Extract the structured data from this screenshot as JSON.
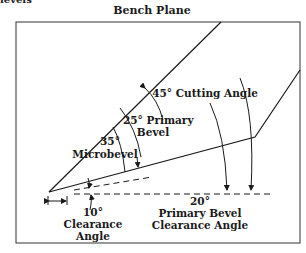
{
  "title": "Bench Plane",
  "top_fragment": "levels",
  "labels": {
    "cutting_angle": "45° Cutting Angle",
    "primary_bevel_deg": "25° Primary",
    "primary_bevel_word": "Bevel",
    "microbevel_deg": "35°",
    "microbevel_word": "Microbevel",
    "clearance_deg": "10°",
    "clearance_word1": "Clearance",
    "clearance_word2": "Angle",
    "pb_clearance_deg": "20°",
    "pb_clearance_word1": "Primary Bevel",
    "pb_clearance_word2": "Clearance Angle"
  },
  "colors": {
    "line": "#1a1a1a",
    "background": "#ffffff"
  }
}
